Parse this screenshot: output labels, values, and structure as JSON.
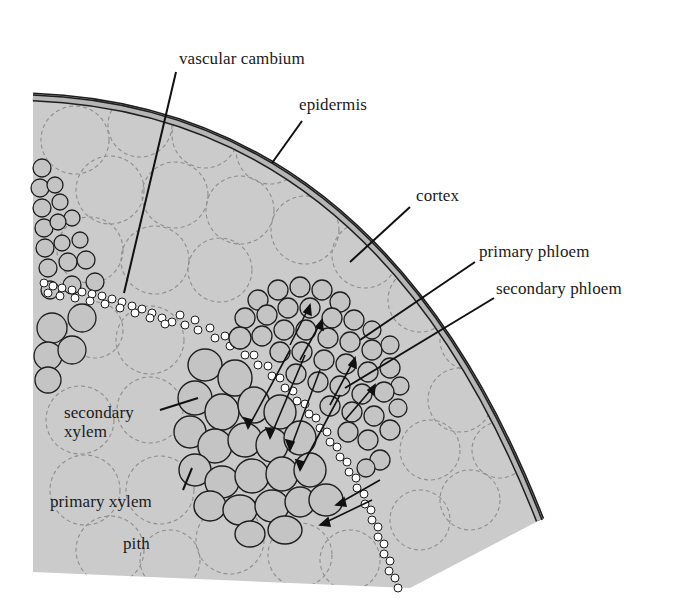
{
  "figure": {
    "colors": {
      "background": "#ffffff",
      "tissue_fill": "#cbcbcb",
      "epidermis_band": "#b5b5b5",
      "outline": "#1e1e1e",
      "cell_dash": "#8e8e8e",
      "vessel_ring": "#6a6a6a",
      "cambium_bead": "#ffffff",
      "leader_line": "#111111"
    }
  },
  "labels": {
    "vascular_cambium": "vascular cambium",
    "epidermis": "epidermis",
    "cortex": "cortex",
    "primary_phloem": "primary phloem",
    "secondary_phloem": "secondary phloem",
    "secondary_xylem_line1": "secondary",
    "secondary_xylem_line2": "xylem",
    "primary_xylem": "primary xylem",
    "pith": "pith"
  }
}
